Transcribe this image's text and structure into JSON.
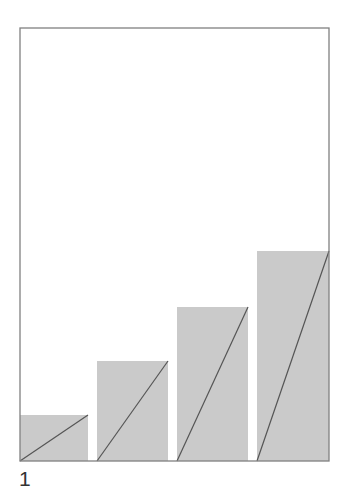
{
  "figure": {
    "label": "1",
    "frame": {
      "x": 20,
      "y": 28,
      "width": 309,
      "height": 433
    },
    "colors": {
      "background": "#ffffff",
      "frame_stroke": "#808080",
      "bar_fill": "#cacaca",
      "diagonal_stroke": "#555555",
      "label": "#333333"
    },
    "bars": [
      {
        "x": 20,
        "width": 68,
        "top": 415
      },
      {
        "x": 97,
        "width": 71,
        "top": 361
      },
      {
        "x": 177,
        "width": 71,
        "top": 307
      },
      {
        "x": 257,
        "width": 72,
        "top": 251
      }
    ],
    "baseline": 461
  }
}
